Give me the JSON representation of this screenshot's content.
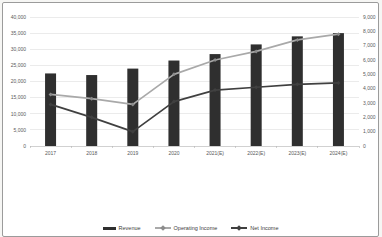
{
  "chart_data": {
    "type": "bar",
    "subtype": "combo-bar-line-dual-axis",
    "title": "",
    "categories": [
      "2017",
      "2018",
      "2019",
      "2020",
      "2021(E)",
      "2022(E)",
      "2023(E)",
      "2024(E)"
    ],
    "series": [
      {
        "name": "Revenue",
        "type": "bar",
        "axis": "left",
        "color": "#2f2f2f",
        "values": [
          22500,
          22000,
          24000,
          26500,
          28500,
          31500,
          34000,
          35000
        ]
      },
      {
        "name": "Operating Income",
        "type": "line",
        "axis": "right",
        "color": "#a9a9a9",
        "marker_color": "#8c8c8c",
        "values": [
          3600,
          3300,
          2900,
          5000,
          6000,
          6600,
          7400,
          7800
        ]
      },
      {
        "name": "Net Income",
        "type": "line",
        "axis": "right",
        "color": "#404040",
        "marker_color": "#404040",
        "values": [
          2900,
          2000,
          1000,
          3100,
          3900,
          4100,
          4300,
          4400
        ]
      }
    ],
    "left_axis": {
      "min": 0,
      "max": 40000,
      "step": 5000,
      "tick_labels": [
        "0",
        "5,000",
        "10,000",
        "15,000",
        "20,000",
        "25,000",
        "30,000",
        "35,000",
        "40,000"
      ]
    },
    "right_axis": {
      "min": 0,
      "max": 9000,
      "step": 1000,
      "tick_labels": [
        "0",
        "1,000",
        "2,000",
        "3,000",
        "4,000",
        "5,000",
        "6,000",
        "7,000",
        "8,000",
        "9,000"
      ]
    },
    "legend": {
      "position": "bottom",
      "entries": [
        "Revenue",
        "Operating Income",
        "Net Income"
      ]
    },
    "grid": true,
    "colors": {
      "gridline": "#dedede",
      "axis_line": "#b3b3b3",
      "tick_text": "#595959",
      "frame": "#9b9b9b"
    }
  }
}
